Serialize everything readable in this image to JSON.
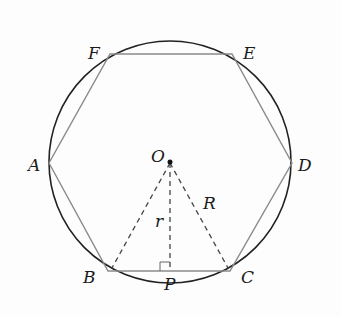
{
  "diagram": {
    "colors": {
      "circle": "#222222",
      "hexagon": "#8a8a8a",
      "dashed": "#444444",
      "text": "#1a1a1a",
      "background": "#fdfdfd"
    },
    "circle": {
      "cx": 170,
      "cy": 162,
      "r": 121
    },
    "center": {
      "label": "O",
      "x": 170,
      "y": 162
    },
    "vertices": [
      {
        "label": "A",
        "x": 49,
        "y": 163
      },
      {
        "label": "B",
        "x": 108,
        "y": 271
      },
      {
        "label": "C",
        "x": 230,
        "y": 271
      },
      {
        "label": "D",
        "x": 292,
        "y": 163
      },
      {
        "label": "E",
        "x": 232,
        "y": 54
      },
      {
        "label": "F",
        "x": 110,
        "y": 54
      }
    ],
    "foot": {
      "label": "P",
      "x": 170,
      "y": 271
    },
    "segment_labels": {
      "apothem": "r",
      "circumradius": "R"
    },
    "labels": {
      "A": "A",
      "B": "B",
      "C": "C",
      "D": "D",
      "E": "E",
      "F": "F",
      "O": "O",
      "P": "P",
      "r": "r",
      "R": "R"
    }
  }
}
